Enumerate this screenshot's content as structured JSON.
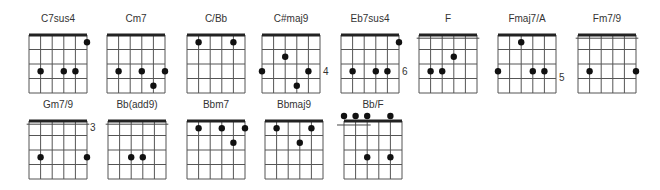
{
  "chart_data": {
    "type": "chord-diagram-set",
    "strings": 6,
    "frets_shown": 4,
    "chords": [
      {
        "name": "C7sus4",
        "x": 29,
        "y": 35,
        "fret_label": "",
        "barre": null,
        "open_dots": [],
        "dots": [
          [
            5,
            0.5
          ],
          [
            1,
            2.5
          ],
          [
            3,
            2.5
          ],
          [
            4,
            2.5
          ]
        ]
      },
      {
        "name": "Cm7",
        "x": 107,
        "y": 35,
        "fret_label": "",
        "barre": null,
        "open_dots": [],
        "dots": [
          [
            1,
            2.5
          ],
          [
            3,
            2.5
          ],
          [
            5,
            2.5
          ],
          [
            4,
            3.5
          ]
        ]
      },
      {
        "name": "C/Bb",
        "x": 187,
        "y": 35,
        "fret_label": "",
        "barre": null,
        "open_dots": [],
        "dots": [
          [
            1,
            0.5
          ],
          [
            4,
            0.5
          ]
        ]
      },
      {
        "name": "C#maj9",
        "x": 262,
        "y": 35,
        "fret_label": "4",
        "label_fret": 2.5,
        "barre": null,
        "open_dots": [],
        "dots": [
          [
            2,
            1.5
          ],
          [
            0,
            2.5
          ],
          [
            4,
            2.5
          ],
          [
            3,
            3.5
          ]
        ]
      },
      {
        "name": "Eb7sus4",
        "x": 341,
        "y": 35,
        "fret_label": "6",
        "label_fret": 2.5,
        "barre": null,
        "open_dots": [],
        "dots": [
          [
            5,
            0.5
          ],
          [
            1,
            2.5
          ],
          [
            3,
            2.5
          ],
          [
            4,
            2.5
          ]
        ]
      },
      {
        "name": "F",
        "x": 419,
        "y": 35,
        "fret_label": "",
        "barre": {
          "from": -0.2,
          "to": 5.2,
          "fret": 0.4
        },
        "open_dots": [],
        "dots": [
          [
            3,
            1.5
          ],
          [
            1,
            2.5
          ],
          [
            2,
            2.5
          ]
        ]
      },
      {
        "name": "Fmaj7/A",
        "x": 498,
        "y": 35,
        "fret_label": "5",
        "label_fret": 2.9,
        "barre": null,
        "open_dots": [],
        "dots": [
          [
            2,
            0.5
          ],
          [
            0,
            2.5
          ],
          [
            3,
            2.5
          ],
          [
            4,
            2.5
          ]
        ]
      },
      {
        "name": "Fm7/9",
        "x": 578,
        "y": 35,
        "fret_label": "",
        "barre": {
          "from": -0.2,
          "to": 5.2,
          "fret": 0.4
        },
        "open_dots": [],
        "dots": [
          [
            1,
            2.5
          ],
          [
            5,
            2.5
          ]
        ]
      },
      {
        "name": "Gm7/9",
        "x": 29,
        "y": 121,
        "fret_label": "3",
        "label_fret": 0.4,
        "barre": {
          "from": -0.2,
          "to": 5.2,
          "fret": 0.4
        },
        "open_dots": [],
        "dots": [
          [
            1,
            2.5
          ],
          [
            5,
            2.5
          ]
        ]
      },
      {
        "name": "Bb(add9)",
        "x": 108,
        "y": 121,
        "fret_label": "",
        "barre": {
          "from": -0.2,
          "to": 5.2,
          "fret": 0.4
        },
        "open_dots": [],
        "dots": [
          [
            2,
            2.5
          ],
          [
            3,
            2.5
          ]
        ]
      },
      {
        "name": "Bbm7",
        "x": 187,
        "y": 121,
        "fret_label": "",
        "barre": null,
        "open_dots": [],
        "dots": [
          [
            1,
            0.5
          ],
          [
            3,
            0.5
          ],
          [
            5,
            0.5
          ],
          [
            4,
            1.5
          ]
        ]
      },
      {
        "name": "Bbmaj9",
        "x": 265,
        "y": 121,
        "fret_label": "",
        "barre": null,
        "open_dots": [],
        "dots": [
          [
            1,
            0.5
          ],
          [
            4,
            0.5
          ],
          [
            3,
            1.5
          ]
        ]
      },
      {
        "name": "Bb/F",
        "x": 344,
        "y": 121,
        "fret_label": "",
        "barre": {
          "from": -0.6,
          "to": 2.3,
          "fret": 0.5
        },
        "open_dots": [
          0,
          1,
          2,
          4
        ],
        "dots": [
          [
            2,
            2.5
          ],
          [
            4,
            2.5
          ]
        ]
      }
    ]
  },
  "style": {
    "line_color": "#555555",
    "nut_color": "#222222",
    "dot_color": "#111111",
    "label_color": "#333333"
  }
}
